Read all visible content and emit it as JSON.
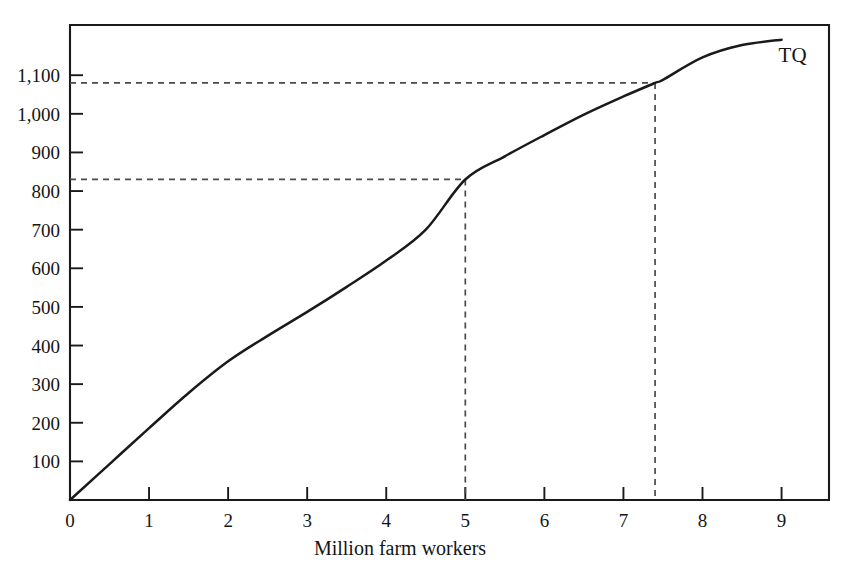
{
  "chart_data": {
    "type": "line",
    "title": "",
    "subtitle": "",
    "xlabel": "Million farm workers",
    "ylabel": "",
    "xlim": [
      0,
      9.6
    ],
    "ylim": [
      0,
      1230
    ],
    "grid": false,
    "legend_position": "inline-curve-end",
    "x_ticks": [
      "0",
      "1",
      "2",
      "3",
      "4",
      "5",
      "6",
      "7",
      "8",
      "9"
    ],
    "x_tick_values": [
      0,
      1,
      2,
      3,
      4,
      5,
      6,
      7,
      8,
      9
    ],
    "y_ticks": [
      "100",
      "200",
      "300",
      "400",
      "500",
      "600",
      "700",
      "800",
      "900",
      "1,000",
      "1,100"
    ],
    "y_tick_values": [
      100,
      200,
      300,
      400,
      500,
      600,
      700,
      800,
      900,
      1000,
      1100
    ],
    "series": [
      {
        "name": "TQ",
        "label": "TQ",
        "color": "#1a1a1a",
        "x": [
          0,
          0.5,
          1,
          1.5,
          2,
          2.5,
          3,
          3.5,
          4,
          4.5,
          5,
          5.5,
          6,
          6.5,
          7,
          7.4,
          7.5,
          8,
          8.5,
          9
        ],
        "values": [
          0,
          93,
          186,
          277,
          359,
          425,
          487,
          552,
          620,
          700,
          830,
          890,
          945,
          998,
          1045,
          1080,
          1088,
          1146,
          1178,
          1192
        ]
      }
    ],
    "annotations": [
      {
        "name": "guide-at-5",
        "x": 5,
        "y": 830,
        "style": "dashed",
        "description": "Dashed guide lines from y-axis and x-axis meeting the TQ curve at 5 million workers, total quantity about 830"
      },
      {
        "name": "guide-at-7-4",
        "x": 7.4,
        "y": 1080,
        "style": "dashed",
        "description": "Dashed guide lines from y-axis and x-axis meeting the TQ curve at 7.4 million workers, total quantity about 1,080"
      }
    ]
  }
}
